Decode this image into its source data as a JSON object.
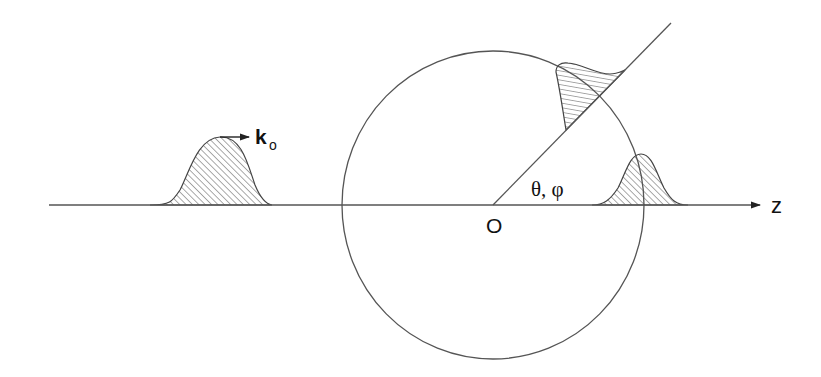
{
  "diagram": {
    "type": "scattering-schematic",
    "colors": {
      "stroke": "#444444",
      "hatch": "#555555",
      "text": "#111111",
      "background": "#ffffff"
    },
    "labels": {
      "wave_vector": "k",
      "wave_vector_subscript": "o",
      "angles": "θ, φ",
      "origin": "O",
      "axis": "z"
    },
    "elements": {
      "axis": {
        "x1": 49,
        "y1": 205,
        "x2": 760,
        "y2": 205,
        "arrow": true
      },
      "scattering_sphere": {
        "cx": 493,
        "cy": 205,
        "rx": 151,
        "ry": 154
      },
      "scattered_ray": {
        "x1": 493,
        "y1": 205,
        "x2": 671,
        "y2": 23
      },
      "incident_packet": {
        "x_start": 162,
        "x_peak": 220,
        "x_end": 272,
        "peak_y": 137,
        "baseline_y": 205
      },
      "transmitted_packet": {
        "x_start": 598,
        "x_peak": 641,
        "x_end": 684,
        "peak_y": 154,
        "baseline_y": 205
      },
      "scattered_packet": {
        "along_ray": true,
        "ray_start_point": [
          566,
          130
        ],
        "ray_end_point": [
          625,
          70
        ]
      },
      "propagation_arrow": {
        "x1": 220,
        "y1": 137,
        "x2": 249,
        "y2": 137
      }
    }
  }
}
